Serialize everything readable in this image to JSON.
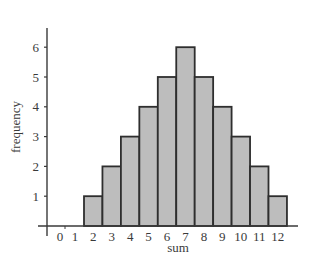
{
  "chart_data": {
    "type": "bar",
    "title": "",
    "xlabel": "sum",
    "ylabel": "frequency",
    "categories": [
      "0",
      "1",
      "2",
      "3",
      "4",
      "5",
      "6",
      "7",
      "8",
      "9",
      "10",
      "11",
      "12"
    ],
    "values": [
      0,
      0,
      1,
      2,
      3,
      4,
      5,
      6,
      5,
      4,
      3,
      2,
      1
    ],
    "y_ticks": [
      1,
      2,
      3,
      4,
      5,
      6
    ],
    "ylim": [
      0,
      6.6
    ],
    "grid": false,
    "legend": null,
    "colors": {
      "bar_fill": "#bdbdbd",
      "bar_stroke": "#2e2e2e",
      "axis": "#3a3a3a"
    }
  }
}
